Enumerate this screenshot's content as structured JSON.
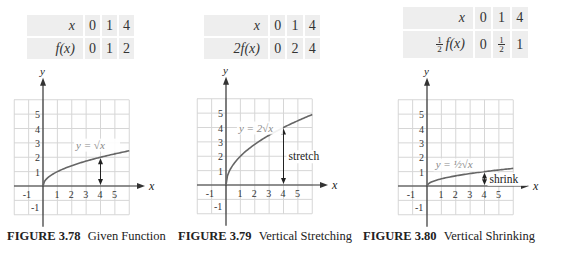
{
  "figures": [
    {
      "id": "3.78",
      "caption_number": "FIGURE 3.78",
      "caption_text": "Given Function",
      "table": {
        "row1_header": "x",
        "row1_values": [
          "0",
          "1",
          "4"
        ],
        "row2_header": "f(x)",
        "row2_values": [
          "0",
          "1",
          "2"
        ]
      },
      "graph": {
        "equation_label": "y = √x",
        "annotation": "",
        "scale": 1
      }
    },
    {
      "id": "3.79",
      "caption_number": "FIGURE 3.79",
      "caption_text": "Vertical Stretching",
      "table": {
        "row1_header": "x",
        "row1_values": [
          "0",
          "1",
          "4"
        ],
        "row2_header": "2f(x)",
        "row2_values": [
          "0",
          "2",
          "4"
        ]
      },
      "graph": {
        "equation_label": "y = 2√x",
        "annotation": "stretch",
        "scale": 2
      }
    },
    {
      "id": "3.80",
      "caption_number": "FIGURE 3.80",
      "caption_text": "Vertical Shrinking",
      "table": {
        "row1_header": "x",
        "row1_values": [
          "0",
          "1",
          "4"
        ],
        "row2_header_prefix": "½",
        "row2_header": "f(x)",
        "row2_values": [
          "0",
          "½",
          "1"
        ]
      },
      "graph": {
        "equation_label": "y = ½√x",
        "annotation": "shrink",
        "scale": 0.5
      }
    }
  ],
  "axes": {
    "x_label": "x",
    "y_label": "y",
    "x_ticks": [
      "-1",
      "1",
      "2",
      "3",
      "4",
      "5"
    ],
    "y_ticks": [
      "-1",
      "1",
      "2",
      "3",
      "4",
      "5"
    ],
    "xlim": [
      -2,
      6
    ],
    "ylim": [
      -2,
      6
    ]
  },
  "colors": {
    "curve": "#666666",
    "grid": "#d6d6d6",
    "axis": "#333333",
    "table_cell": "#eeeeee"
  },
  "chart_data": [
    {
      "type": "line",
      "title": "FIGURE 3.78 Given Function",
      "series": [
        {
          "name": "y = √x",
          "x": [
            0,
            1,
            4,
            6
          ],
          "y": [
            0,
            1,
            2,
            2.449
          ]
        }
      ],
      "xlabel": "x",
      "ylabel": "y",
      "xlim": [
        -2,
        6
      ],
      "ylim": [
        -2,
        6
      ],
      "grid": true,
      "annotations": [
        "double arrow at x=4 from y=0 to y=2"
      ]
    },
    {
      "type": "line",
      "title": "FIGURE 3.79 Vertical Stretching",
      "series": [
        {
          "name": "y = 2√x",
          "x": [
            0,
            1,
            4,
            6
          ],
          "y": [
            0,
            2,
            4,
            4.899
          ]
        }
      ],
      "xlabel": "x",
      "ylabel": "y",
      "xlim": [
        -2,
        6
      ],
      "ylim": [
        -2,
        6
      ],
      "grid": true,
      "annotations": [
        "stretch: double arrow at x=4 from y=0 to y=4"
      ]
    },
    {
      "type": "line",
      "title": "FIGURE 3.80 Vertical Shrinking",
      "series": [
        {
          "name": "y = ½√x",
          "x": [
            0,
            1,
            4,
            6
          ],
          "y": [
            0,
            0.5,
            1,
            1.225
          ]
        }
      ],
      "xlabel": "x",
      "ylabel": "y",
      "xlim": [
        -2,
        6
      ],
      "ylim": [
        -2,
        6
      ],
      "grid": true,
      "annotations": [
        "shrink: double arrow at x=4 from y=0 to y=1"
      ]
    }
  ]
}
